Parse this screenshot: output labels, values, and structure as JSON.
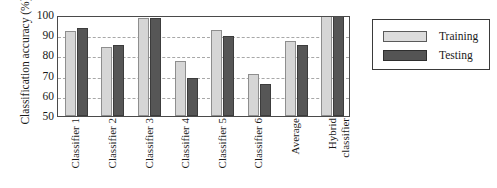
{
  "chart_data": {
    "type": "bar",
    "title": "",
    "xlabel": "",
    "ylabel": "Classification accuracy (%)",
    "ylim": [
      50,
      100
    ],
    "yticks": [
      50,
      60,
      70,
      80,
      90,
      100
    ],
    "grid": true,
    "gridlines_at": [
      60,
      70,
      80,
      90
    ],
    "legend_position": "right-outside",
    "categories": [
      "Classifier 1",
      "Classifier 2",
      "Classifier 3",
      "Classifier 4",
      "Classifier 5",
      "Classifier 6",
      "Average",
      "Hybrid classifier"
    ],
    "category_label_lines": [
      [
        "Classifier 1"
      ],
      [
        "Classifier 2"
      ],
      [
        "Classifier 3"
      ],
      [
        "Classifier 4"
      ],
      [
        "Classifier 5"
      ],
      [
        "Classifier 6"
      ],
      [
        "Average"
      ],
      [
        "Hybrid",
        "classifier"
      ]
    ],
    "series": [
      {
        "name": "Training",
        "color": "#d6d6d6",
        "values": [
          92.0,
          84.0,
          98.5,
          77.0,
          92.5,
          71.0,
          87.0,
          100.0
        ]
      },
      {
        "name": "Testing",
        "color": "#565656",
        "values": [
          93.5,
          85.0,
          98.5,
          69.0,
          89.5,
          66.0,
          85.0,
          100.0
        ]
      }
    ]
  },
  "legend": {
    "items": [
      {
        "label": "Training",
        "swatch": "training"
      },
      {
        "label": "Testing",
        "swatch": "testing"
      }
    ]
  },
  "colors": {
    "training": "#d6d6d6",
    "testing": "#565656",
    "axis": "#4a4a4a",
    "grid": "#a8a8a8",
    "background": "#ffffff"
  }
}
